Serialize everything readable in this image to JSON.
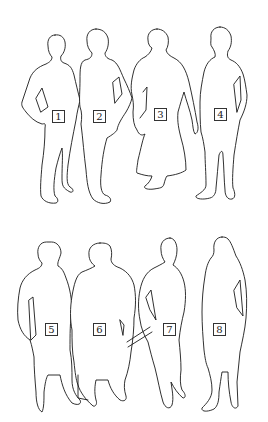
{
  "figure": {
    "stroke_color": "#1a1a1a",
    "background": "#ffffff",
    "rows": [
      {
        "name": "top-row",
        "figures": [
          {
            "id": 1,
            "label": "1",
            "kind": "man-hands-on-hips"
          },
          {
            "id": 2,
            "label": "2",
            "kind": "man"
          },
          {
            "id": 3,
            "label": "3",
            "kind": "woman-in-skirt"
          },
          {
            "id": 4,
            "label": "4",
            "kind": "man"
          }
        ]
      },
      {
        "name": "bottom-row",
        "figures": [
          {
            "id": 5,
            "label": "5",
            "kind": "person-in-skirt"
          },
          {
            "id": 6,
            "label": "6",
            "kind": "woman-in-long-dress"
          },
          {
            "id": 7,
            "label": "7",
            "kind": "man"
          },
          {
            "id": 8,
            "label": "8",
            "kind": "long-haired-woman"
          }
        ]
      }
    ]
  }
}
